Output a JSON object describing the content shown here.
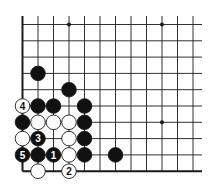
{
  "diagram": {
    "type": "go-board-fragment",
    "grid": {
      "columns": 12,
      "rows": 10,
      "origin_x": 22.5,
      "origin_y": 24.5,
      "spacing_x": 15.5,
      "spacing_y": 16.3,
      "line_extent_right": 202,
      "line_extent_top": 16,
      "border_left": true,
      "border_bottom": true
    },
    "colors": {
      "line": "#1a1a1a",
      "black_stone": "#111111",
      "white_stone": "#ffffff",
      "background": "#ffffff"
    },
    "star_points": [
      {
        "col": 3,
        "row": 0
      },
      {
        "col": 9,
        "row": 0
      },
      {
        "col": 9,
        "row": 6
      }
    ],
    "stones": [
      {
        "col": 1,
        "row": 3,
        "color": "black",
        "label": ""
      },
      {
        "col": 3,
        "row": 4,
        "color": "black",
        "label": ""
      },
      {
        "col": 0,
        "row": 5,
        "color": "white",
        "label": "4"
      },
      {
        "col": 1,
        "row": 5,
        "color": "black",
        "label": ""
      },
      {
        "col": 2,
        "row": 5,
        "color": "black",
        "label": ""
      },
      {
        "col": 4,
        "row": 5,
        "color": "black",
        "label": ""
      },
      {
        "col": 0,
        "row": 6,
        "color": "black",
        "label": ""
      },
      {
        "col": 1,
        "row": 6,
        "color": "white",
        "label": ""
      },
      {
        "col": 2,
        "row": 6,
        "color": "white",
        "label": ""
      },
      {
        "col": 3,
        "row": 6,
        "color": "white",
        "label": ""
      },
      {
        "col": 4,
        "row": 6,
        "color": "black",
        "label": ""
      },
      {
        "col": 0,
        "row": 7,
        "color": "white",
        "label": ""
      },
      {
        "col": 1,
        "row": 7,
        "color": "black",
        "label": "3"
      },
      {
        "col": 3,
        "row": 7,
        "color": "white",
        "label": ""
      },
      {
        "col": 4,
        "row": 7,
        "color": "black",
        "label": ""
      },
      {
        "col": 0,
        "row": 8,
        "color": "black",
        "label": "5"
      },
      {
        "col": 1,
        "row": 8,
        "color": "black",
        "label": ""
      },
      {
        "col": 2,
        "row": 8,
        "color": "black",
        "label": "1"
      },
      {
        "col": 3,
        "row": 8,
        "color": "white",
        "label": ""
      },
      {
        "col": 4,
        "row": 8,
        "color": "black",
        "label": ""
      },
      {
        "col": 6,
        "row": 8,
        "color": "black",
        "label": ""
      },
      {
        "col": 1,
        "row": 9,
        "color": "white",
        "label": ""
      },
      {
        "col": 3,
        "row": 9,
        "color": "white",
        "label": "2"
      }
    ]
  }
}
